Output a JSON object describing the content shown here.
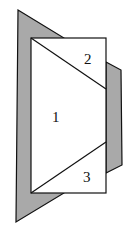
{
  "diagram": {
    "labels": [
      {
        "id": "region-1",
        "text": "1",
        "x": 52,
        "y": 122
      },
      {
        "id": "region-2",
        "text": "2",
        "x": 88,
        "y": 63
      },
      {
        "id": "region-3",
        "text": "3",
        "x": 87,
        "y": 182
      }
    ],
    "colors": {
      "shaded": "#a9a9a9",
      "stroke": "#111111",
      "fill": "#ffffff"
    }
  }
}
